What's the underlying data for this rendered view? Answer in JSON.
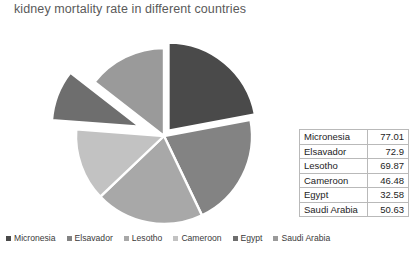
{
  "chart_data": {
    "type": "pie",
    "title": "kidney mortality rate in different countries",
    "categories": [
      "Micronesia",
      "Elsavador",
      "Lesotho",
      "Cameroon",
      "Egypt",
      "Saudi Arabia"
    ],
    "values": [
      77.01,
      72.9,
      69.87,
      46.48,
      32.58,
      50.63
    ],
    "total": 349.47,
    "slice_colors": [
      "#4a4a4a",
      "#838383",
      "#a8a8a8",
      "#c2c2c2",
      "#6e6e6e",
      "#9a9a9a"
    ],
    "exploded": [
      "Egypt",
      "Micronesia"
    ],
    "start_angle_deg": 0,
    "direction": "clockwise",
    "legend_position": "bottom",
    "grid": false,
    "xlabel": "",
    "ylabel": ""
  },
  "title": "kidney mortality rate in different countries",
  "table": {
    "rows": [
      {
        "country": "Micronesia",
        "value": "77.01"
      },
      {
        "country": "Elsavador",
        "value": "72.9"
      },
      {
        "country": "Lesotho",
        "value": "69.87"
      },
      {
        "country": "Cameroon",
        "value": "46.48"
      },
      {
        "country": "Egypt",
        "value": "32.58"
      },
      {
        "country": "Saudi Arabia",
        "value": "50.63"
      }
    ]
  },
  "legend": {
    "items": [
      {
        "label": "Micronesia",
        "color": "#4a4a4a"
      },
      {
        "label": "Elsavador",
        "color": "#838383"
      },
      {
        "label": "Lesotho",
        "color": "#a8a8a8"
      },
      {
        "label": "Cameroon",
        "color": "#c2c2c2"
      },
      {
        "label": "Egypt",
        "color": "#6e6e6e"
      },
      {
        "label": "Saudi Arabia",
        "color": "#9a9a9a"
      }
    ]
  }
}
